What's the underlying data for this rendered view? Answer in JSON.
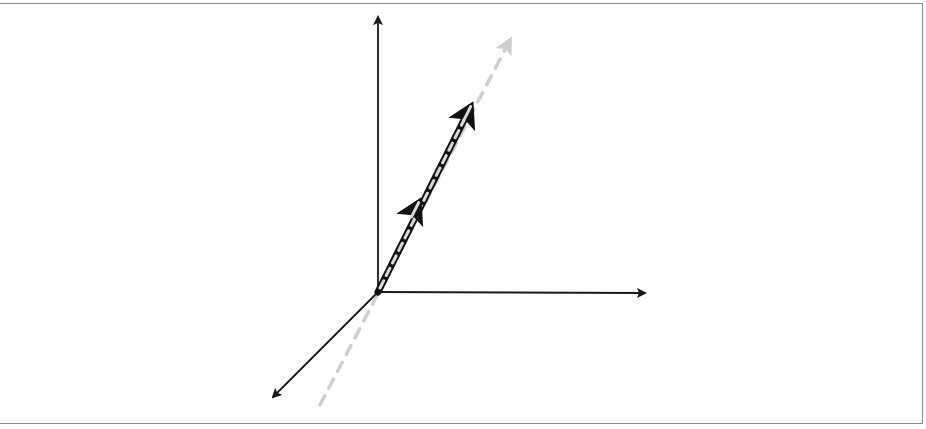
{
  "diagram": {
    "type": "3d-axes-vector",
    "colors": {
      "axis": "#1a1a1a",
      "vector": "#111111",
      "vector_dash": "#d8d8d8",
      "guide_line": "#c8c8c8",
      "frame": "#8a8a8a",
      "background": "#ffffff"
    },
    "origin": [
      378,
      292
    ],
    "axes": [
      {
        "name": "vertical-axis",
        "end": [
          378,
          16
        ]
      },
      {
        "name": "horizontal-axis",
        "end": [
          646,
          293
        ]
      },
      {
        "name": "depth-axis",
        "end": [
          272,
          398
        ]
      }
    ],
    "guide_line": {
      "start": [
        320,
        405
      ],
      "end": [
        512,
        37
      ]
    },
    "vector": {
      "start": [
        378,
        292
      ],
      "end": [
        468,
        110
      ],
      "arrowheads": 2
    }
  }
}
